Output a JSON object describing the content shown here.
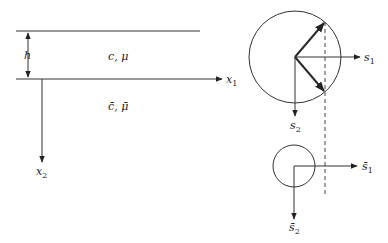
{
  "left_panel": {
    "layer_label": "c, μ",
    "halfspace_label": "c̄, μ̄",
    "thickness_label": "h",
    "x1_axis": {
      "name": "x",
      "sub": "1"
    },
    "x2_axis": {
      "name": "x",
      "sub": "2"
    }
  },
  "right_panel": {
    "upper_circle": {
      "s1_axis": {
        "name": "s",
        "sub": "1"
      },
      "s2_axis": {
        "name": "s",
        "sub": "2"
      }
    },
    "lower_circle": {
      "s1_axis": {
        "name": "s̄",
        "sub": "1"
      },
      "s2_axis": {
        "name": "s̄",
        "sub": "2"
      }
    }
  },
  "colors": {
    "line": "#333333",
    "background": "#ffffff"
  }
}
